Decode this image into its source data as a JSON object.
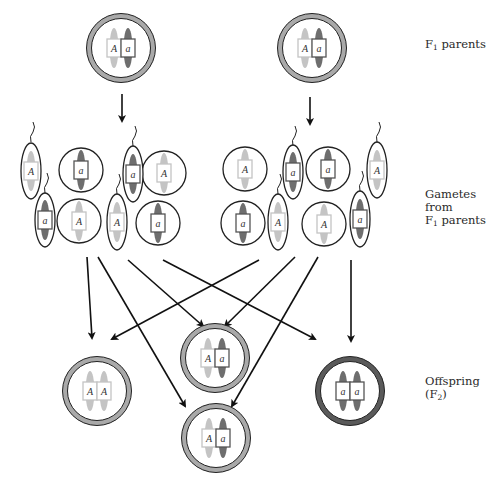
{
  "labels": {
    "f1_parents": {
      "prefix": "F",
      "sub": "1",
      "suffix": " parents"
    },
    "gametes": {
      "line1": "Gametes from",
      "prefix": "F",
      "sub": "1",
      "suffix": " parents"
    },
    "offspring": {
      "line1": "Offspring",
      "prefix": "(F",
      "sub": "2",
      "suffix": ")"
    }
  },
  "colors": {
    "dominant_chromosome": "#c4c4c4",
    "recessive_chromosome": "#6e6e6e",
    "parent_ring": "#a9a9a9",
    "homozygous_recessive_ring": "#5a5a5a",
    "outline": "#222222"
  },
  "parents": [
    {
      "id": "parent-left",
      "alleles": [
        "A",
        "a"
      ]
    },
    {
      "id": "parent-right",
      "alleles": [
        "A",
        "a"
      ]
    }
  ],
  "gametes": [
    {
      "type": "sperm",
      "allele": "A"
    },
    {
      "type": "egg",
      "allele": "a"
    },
    {
      "type": "sperm",
      "allele": "a"
    },
    {
      "type": "egg",
      "allele": "A"
    },
    {
      "type": "sperm",
      "allele": "a"
    },
    {
      "type": "egg",
      "allele": "A"
    },
    {
      "type": "sperm",
      "allele": "A"
    },
    {
      "type": "egg",
      "allele": "a"
    },
    {
      "type": "egg",
      "allele": "A"
    },
    {
      "type": "sperm",
      "allele": "a"
    },
    {
      "type": "egg",
      "allele": "a"
    },
    {
      "type": "sperm",
      "allele": "A"
    },
    {
      "type": "egg",
      "allele": "a"
    },
    {
      "type": "sperm",
      "allele": "A"
    },
    {
      "type": "egg",
      "allele": "A"
    },
    {
      "type": "sperm",
      "allele": "a"
    }
  ],
  "offspring": [
    {
      "genotype": "AA",
      "alleles": [
        "A",
        "A"
      ]
    },
    {
      "genotype": "Aa",
      "alleles": [
        "A",
        "a"
      ]
    },
    {
      "genotype": "Aa",
      "alleles": [
        "A",
        "a"
      ]
    },
    {
      "genotype": "aa",
      "alleles": [
        "a",
        "a"
      ]
    }
  ]
}
